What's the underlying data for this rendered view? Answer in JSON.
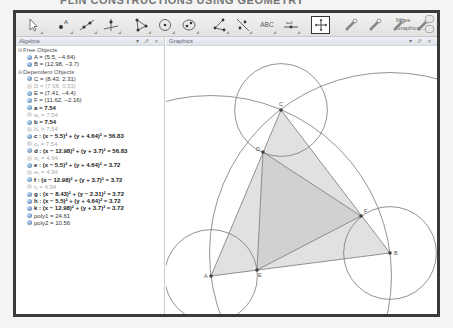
{
  "page_title": "PLIN CONSTRUCTIONS USING GEOMETRY",
  "toolbar": {
    "tools": [
      {
        "name": "move-tool",
        "icon": "pointer-arrow-icon"
      },
      {
        "name": "point-tool",
        "icon": "point-icon",
        "label": "A"
      },
      {
        "name": "line-tool",
        "icon": "line-through-points-icon"
      },
      {
        "name": "perpendicular-tool",
        "icon": "perpendicular-line-icon"
      },
      {
        "name": "polygon-tool",
        "icon": "polygon-icon"
      },
      {
        "name": "circle-tool",
        "icon": "circle-center-point-icon"
      },
      {
        "name": "ellipse-tool",
        "icon": "conic-icon"
      },
      {
        "name": "angle-tool",
        "icon": "angle-icon"
      },
      {
        "name": "reflect-tool",
        "icon": "reflect-about-line-icon"
      },
      {
        "name": "text-tool",
        "icon": "text-icon",
        "label": "ABC"
      },
      {
        "name": "slider-tool",
        "icon": "slider-icon",
        "label": "a=1"
      },
      {
        "name": "move-graphics-tool",
        "icon": "move-graphics-icon",
        "active": true
      },
      {
        "name": "custom-tool-1",
        "icon": "wrench-icon"
      },
      {
        "name": "custom-tool-2",
        "icon": "wrench-icon"
      },
      {
        "name": "custom-tool-3",
        "icon": "wrench-icon"
      },
      {
        "name": "custom-tool-4",
        "icon": "wrench-icon"
      }
    ],
    "help_line1": "Move",
    "help_line2": "Graphics..."
  },
  "algebra": {
    "title": "Algebra",
    "controls": "▾ ⇗ ×",
    "groups": [
      {
        "label": "Free Objects",
        "items": [
          {
            "text": "A = (5.5, −4.64)",
            "style": "normal"
          },
          {
            "text": "B = (12.98, −3.7)",
            "style": "normal"
          }
        ]
      },
      {
        "label": "Dependent Objects",
        "items": [
          {
            "text": "C = (8.43, 2.31)",
            "style": "normal"
          },
          {
            "text": "D = (7.68, 0.53)",
            "style": "hidden"
          },
          {
            "text": "E = (7.41, −4.4)",
            "style": "normal"
          },
          {
            "text": "F = (11.62, −2.16)",
            "style": "normal"
          },
          {
            "text": "a = 7.54",
            "style": "bold"
          },
          {
            "text": "a₁ = 7.54",
            "style": "hidden"
          },
          {
            "text": "b = 7.54",
            "style": "bold"
          },
          {
            "text": "b₁ = 7.54",
            "style": "hidden"
          },
          {
            "text": "c : (x − 5.5)² + (y + 4.64)² = 56.83",
            "style": "bold"
          },
          {
            "text": "c₁ = 7.54",
            "style": "hidden"
          },
          {
            "text": "d : (x − 12.98)² + (y + 3.7)² = 56.83",
            "style": "bold"
          },
          {
            "text": "d₁ = 4.94",
            "style": "hidden"
          },
          {
            "text": "e : (x − 5.5)² + (y + 4.64)² = 3.72",
            "style": "bold"
          },
          {
            "text": "e₁ = 4.94",
            "style": "hidden"
          },
          {
            "text": "f : (x − 12.98)² + (y + 3.7)² = 3.72",
            "style": "bold"
          },
          {
            "text": "f₁ = 4.94",
            "style": "hidden"
          },
          {
            "text": "g : (x − 8.43)² + (y − 2.31)² = 3.72",
            "style": "bold"
          },
          {
            "text": "h : (x − 5.5)² + (y + 4.64)² = 3.72",
            "style": "bold"
          },
          {
            "text": "k : (x − 12.98)² + (y + 3.7)² = 3.72",
            "style": "bold"
          },
          {
            "text": "poly1 = 24.61",
            "style": "normal"
          },
          {
            "text": "poly2 = 10.56",
            "style": "normal"
          }
        ]
      }
    ]
  },
  "graphics": {
    "title": "Graphics",
    "controls": "▾ ⇗ ×",
    "points": {
      "A": {
        "x": 45,
        "y": 230,
        "label": "A"
      },
      "B": {
        "x": 224,
        "y": 207,
        "label": "B"
      },
      "C": {
        "x": 115,
        "y": 64,
        "label": "C"
      },
      "D": {
        "x": 97,
        "y": 106,
        "label": "D"
      },
      "E": {
        "x": 91,
        "y": 224,
        "label": "E"
      },
      "F": {
        "x": 195,
        "y": 170,
        "label": "F"
      }
    },
    "colors": {
      "stroke": "#777777",
      "poly1_fill": "#dcdcdc",
      "poly2_fill": "#cfcfcf",
      "point": "#444444"
    }
  }
}
